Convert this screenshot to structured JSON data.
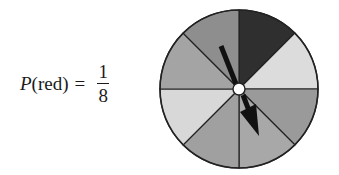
{
  "formula": {
    "func": "P",
    "open": "(",
    "arg": "red",
    "close": ")",
    "equals": "=",
    "numerator": "1",
    "denominator": "8"
  },
  "spinner": {
    "center": [
      89,
      89
    ],
    "radius": 79,
    "segments": [
      {
        "index": 0,
        "from_deg": -90,
        "to_deg": -45,
        "color": "#2f2f2f",
        "label": "red"
      },
      {
        "index": 1,
        "from_deg": -45,
        "to_deg": 0,
        "color": "#dcdcdc"
      },
      {
        "index": 2,
        "from_deg": 0,
        "to_deg": 45,
        "color": "#9a9a9a"
      },
      {
        "index": 3,
        "from_deg": 45,
        "to_deg": 90,
        "color": "#a8a8a8"
      },
      {
        "index": 4,
        "from_deg": 90,
        "to_deg": 135,
        "color": "#a0a0a0"
      },
      {
        "index": 5,
        "from_deg": 135,
        "to_deg": 180,
        "color": "#d8d8d8"
      },
      {
        "index": 6,
        "from_deg": 180,
        "to_deg": 225,
        "color": "#a4a4a4"
      },
      {
        "index": 7,
        "from_deg": 225,
        "to_deg": 270,
        "color": "#8e8e8e"
      }
    ],
    "outline_color": "#222222",
    "arrow_color": "#111111"
  }
}
